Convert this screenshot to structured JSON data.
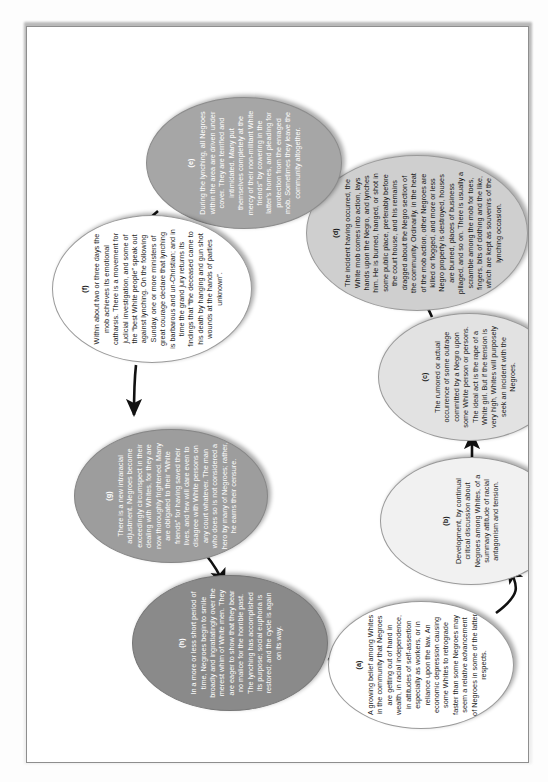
{
  "document": {
    "type": "cycle-diagram",
    "caption": "",
    "orientation": "landscape page shown rotated 90 degrees",
    "node_count": 8
  },
  "diagram": {
    "title": "",
    "nodes": [
      {
        "id": "a",
        "label": "(a)",
        "shade": "s0",
        "text": "A growing belief among Whites in the community that Negroes are getting out of hand in wealth, in racial independence, in attitudes of self-assertion especially as workers, or in reliance upon the law. An economic depression causing some Whites to retrograde faster than some Negroes may seem a relative advancement of Negroes in some of the latter respects."
      },
      {
        "id": "b",
        "label": "(b)",
        "shade": "s1",
        "text": "Development, by continual critical discussion about Negroes among Whites, of a summary attitude of racial antagonism and tension."
      },
      {
        "id": "c",
        "label": "(c)",
        "shade": "s2",
        "text": "The rumored or actual occurrence of some outrage committed by a Negro upon some White person or persons. The ideal act is the rape of a White girl. But if the tension is very high, Whites will purposely seek an incident with the Negroes."
      },
      {
        "id": "d",
        "label": "(d)",
        "shade": "s3",
        "text": "The incident having occurred, the White mob comes into action, lays hands upon the Negro, and lynches him. He is burned, hanged, or shot in some public place, preferably before the court house, and his remains dragged about the Negro section of the community. Ordinarily, in the heat of the mob action, other Negroes are killed or flogged, and more or less Negro property is destroyed, houses are burned, places of business pillaged, and so on. There is usually a scramble among the mob for toes, fingers, bits of clothing and the like, which are kept as souvenirs of the lynching occasion."
      },
      {
        "id": "e",
        "label": "(e)",
        "shade": "s4",
        "text": "During the lynching, all Negroes within the area are driven under cover. They are terrified and intimidated. Many put themselves completely at the mercy of their non-militant White friends” by cowering in the latter's homes, and pleading for protection from the enraged mob. Sometimes they leave the community altogether."
      },
      {
        "id": "f",
        "label": "(f)",
        "shade": "s5",
        "text": "Within about two or three days the mob achieves its emotional catharsis. There is a movement for judicial investigation, and some of the “best White people” speak out against lynching. On the following Sunday, one or more ministers of great courage declare that lynching is barbarous and un-Christian; and in time the grand jury returns its findings that “the deceased came to his death by hanging and gun shot wounds at the hands of parties unknown”."
      },
      {
        "id": "g",
        "label": "(g)",
        "shade": "s6",
        "text": "There is a new intraracial adjustment. Negroes become exceedingly circumspect in their dealing with Whites, for they are now thoroughly frightened. Many are obligated to their “White friends” for having saved their lives, and few will dare even to disagree with White persons on any court whatever. The man who does so is not considered a hero by many of Negroes; rather, he earns their censure."
      },
      {
        "id": "h",
        "label": "(h)",
        "shade": "s7",
        "text": "In a more or less short period of time, Negroes begin to smile broadly and ingratiatingly over the merest whim of White men. They are eager to show that they bear no malice for the horrible past. The lynching has accomplished its purpose; social euphoria is restored; and the cycle is again on its way."
      }
    ],
    "edges": [
      {
        "from": "a",
        "to": "b"
      },
      {
        "from": "b",
        "to": "c"
      },
      {
        "from": "c",
        "to": "d"
      },
      {
        "from": "d",
        "to": "e"
      },
      {
        "from": "e",
        "to": "f"
      },
      {
        "from": "f",
        "to": "g"
      },
      {
        "from": "g",
        "to": "h"
      },
      {
        "from": "h",
        "to": "a"
      }
    ]
  }
}
